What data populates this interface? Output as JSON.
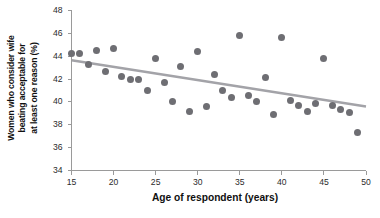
{
  "chart_data": {
    "type": "scatter",
    "title": "",
    "xlabel": "Age of respondent (years)",
    "ylabel": "Women who consider wife beating acceptable for at least one reason (%)",
    "ylabel_lines": [
      "Women who consider wife",
      "beating acceptable for",
      "at least one reason (%)"
    ],
    "xlim": [
      15,
      50
    ],
    "ylim": [
      34,
      48
    ],
    "xticks": [
      15,
      20,
      25,
      30,
      35,
      40,
      45,
      50
    ],
    "yticks": [
      34,
      36,
      38,
      40,
      42,
      44,
      46,
      48
    ],
    "xtick_labels": [
      "15",
      "20",
      "25",
      "30",
      "35",
      "40",
      "45",
      "50"
    ],
    "ytick_labels": [
      "34",
      "36",
      "38",
      "40",
      "42",
      "44",
      "46",
      "48"
    ],
    "grid": false,
    "legend": "none",
    "x": [
      15,
      16,
      17,
      18,
      19,
      20,
      21,
      22,
      23,
      24,
      25,
      26,
      27,
      28,
      29,
      30,
      31,
      32,
      33,
      34,
      35,
      36,
      37,
      38,
      39,
      40,
      41,
      42,
      43,
      44,
      45,
      46,
      47,
      48,
      49
    ],
    "y": [
      44.2,
      44.2,
      43.3,
      44.5,
      42.7,
      44.7,
      42.2,
      42.0,
      42.0,
      41.0,
      43.8,
      41.7,
      40.0,
      43.1,
      39.2,
      44.4,
      39.6,
      42.4,
      41.0,
      40.4,
      45.8,
      40.6,
      40.0,
      42.1,
      38.9,
      45.6,
      40.1,
      39.7,
      39.2,
      39.9,
      43.8,
      39.7,
      39.3,
      39.1,
      37.3
    ],
    "series": [
      {
        "name": "Respondents",
        "marker": "circle",
        "color": "#6e6e73",
        "values": [
          44.2,
          44.2,
          43.3,
          44.5,
          42.7,
          44.7,
          42.2,
          42.0,
          42.0,
          41.0,
          43.8,
          41.7,
          40.0,
          43.1,
          39.2,
          44.4,
          39.6,
          42.4,
          41.0,
          40.4,
          45.8,
          40.6,
          40.0,
          42.1,
          38.9,
          45.6,
          40.1,
          39.7,
          39.2,
          39.9,
          43.8,
          39.7,
          39.3,
          39.1,
          37.3
        ]
      }
    ],
    "trendline": {
      "type": "linear-fit",
      "color": "#a3a3a8",
      "x_start": 15,
      "y_start": 43.65,
      "x_end": 50,
      "y_end": 39.6
    }
  }
}
